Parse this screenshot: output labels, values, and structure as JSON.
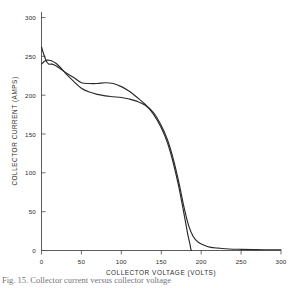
{
  "figure": {
    "caption": "Fig. 15.  Collector current versus collector voltage",
    "background_color": "#ffffff",
    "curve_color": "#2a2a2a",
    "axis_color": "#4a4a4a"
  },
  "chart_data": {
    "type": "line",
    "title": "",
    "xlabel": "COLLECTOR VOLTAGE (VOLTS)",
    "ylabel": "COLLECTOR CURRENT (AMPS)",
    "xlim": [
      0,
      300
    ],
    "ylim": [
      0,
      300
    ],
    "xticks": [
      0,
      50,
      100,
      150,
      200,
      250,
      300
    ],
    "yticks": [
      0,
      50,
      100,
      150,
      200,
      250,
      300
    ],
    "xticklabels": [
      "0",
      "50",
      "100",
      "150",
      "200",
      "250",
      "300"
    ],
    "yticklabels": [
      "0",
      "50",
      "100",
      "150",
      "200",
      "250",
      "300"
    ],
    "grid": false,
    "legend": false,
    "legend_position": "none",
    "series": [
      {
        "name": "upper-curve",
        "x": [
          0,
          3,
          6,
          9,
          13,
          18,
          25,
          32,
          40,
          50,
          60,
          70,
          80,
          90,
          100,
          110,
          120,
          130,
          140,
          150,
          158,
          165,
          172,
          178,
          183,
          186,
          187,
          188
        ],
        "y": [
          262,
          252,
          244,
          240,
          240,
          238,
          233,
          228,
          223,
          216,
          215,
          215,
          216,
          215,
          211,
          205,
          197,
          188,
          176,
          158,
          138,
          113,
          82,
          50,
          22,
          8,
          2,
          0
        ]
      },
      {
        "name": "lower-curve",
        "x": [
          0,
          3,
          6,
          9,
          13,
          18,
          25,
          32,
          40,
          50,
          60,
          70,
          80,
          90,
          100,
          110,
          120,
          130,
          140,
          150,
          158,
          165,
          172,
          178,
          184,
          190,
          196,
          203,
          212,
          222,
          235,
          250,
          265,
          280,
          300
        ],
        "y": [
          240,
          243,
          245,
          245,
          244,
          241,
          234,
          226,
          218,
          209,
          204,
          201,
          199,
          198,
          197,
          195,
          192,
          187,
          178,
          161,
          142,
          118,
          88,
          58,
          33,
          18,
          11,
          7,
          4,
          3,
          2,
          1.5,
          1.2,
          1,
          1
        ]
      }
    ]
  },
  "axes": {
    "x_title": "COLLECTOR VOLTAGE (VOLTS)",
    "y_title": "COLLECTOR CURRENT (AMPS)"
  }
}
